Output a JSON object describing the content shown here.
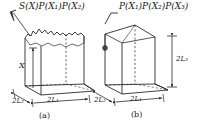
{
  "figure": {
    "name": "two-box-roughness-diagram",
    "stroke_color": "#2b2b2b",
    "text_color": "#1a1a1a",
    "panels": [
      {
        "id": "a",
        "caption": "(a)",
        "top_label": "S(X)P(X₁)P(X₂)",
        "top_label_parts": [
          "S(X)",
          "P(X",
          "1",
          ")P(X",
          "2",
          ")"
        ],
        "surface_type": "rough-jagged",
        "height_label": "X",
        "width_label": "2L₁",
        "depth_label": "2L₂",
        "dimension_labels": [
          "2L₂",
          "2L₁"
        ],
        "has_leader_arrow": true,
        "has_vertical_dimension_arrow": true
      },
      {
        "id": "b",
        "caption": "(b)",
        "top_label": "P(X₁)P(X₂)P(X₃)",
        "top_label_parts": [
          "P(X",
          "1",
          ")P(X",
          "2",
          ")P(X",
          "3",
          ")"
        ],
        "surface_type": "smooth-peak",
        "height_label": "2L₃",
        "width_label": "2L₁",
        "depth_label": "2L₂",
        "dimension_labels": [
          "2L₂",
          "2L₁",
          "2L₃"
        ],
        "has_marker_dot": true,
        "has_vertical_dimension_arrow": true
      }
    ]
  }
}
